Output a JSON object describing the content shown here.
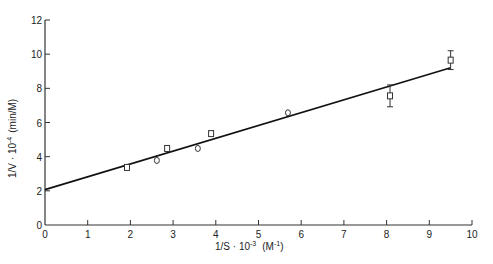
{
  "chart_data": {
    "type": "scatter",
    "title": "",
    "xlabel": "1/S · 10⁻³ (M⁻¹)",
    "ylabel": "1/V · 10⁻⁴ (min/M)",
    "xlim": [
      0,
      10
    ],
    "ylim": [
      0,
      12
    ],
    "x_ticks": [
      0,
      1,
      2,
      3,
      4,
      5,
      6,
      7,
      8,
      9,
      10
    ],
    "y_ticks": [
      0,
      2,
      4,
      6,
      8,
      10,
      12
    ],
    "grid": false,
    "legend": null,
    "series": [
      {
        "name": "squares",
        "marker": "square",
        "points": [
          {
            "x": 1.92,
            "y": 3.37
          },
          {
            "x": 2.86,
            "y": 4.48
          },
          {
            "x": 3.89,
            "y": 5.35
          },
          {
            "x": 8.08,
            "y": 7.56,
            "err": 0.64
          },
          {
            "x": 9.5,
            "y": 9.65,
            "err": 0.55
          }
        ]
      },
      {
        "name": "circles",
        "marker": "circle",
        "points": [
          {
            "x": 2.62,
            "y": 3.78
          },
          {
            "x": 3.58,
            "y": 4.48
          },
          {
            "x": 5.69,
            "y": 6.57
          }
        ]
      },
      {
        "name": "linear fit",
        "type": "line",
        "points": [
          {
            "x": 0,
            "y": 2.07
          },
          {
            "x": 9.5,
            "y": 9.2
          }
        ]
      }
    ]
  },
  "axis": {
    "x_title_main": "1/S · 10",
    "x_title_exp": "-3",
    "x_title_unit": "(M",
    "x_title_unit_exp": "-1",
    "x_title_close": ")",
    "y_title_main": "1/V · 10",
    "y_title_exp": "-4",
    "y_title_unit": "(min/M)"
  }
}
